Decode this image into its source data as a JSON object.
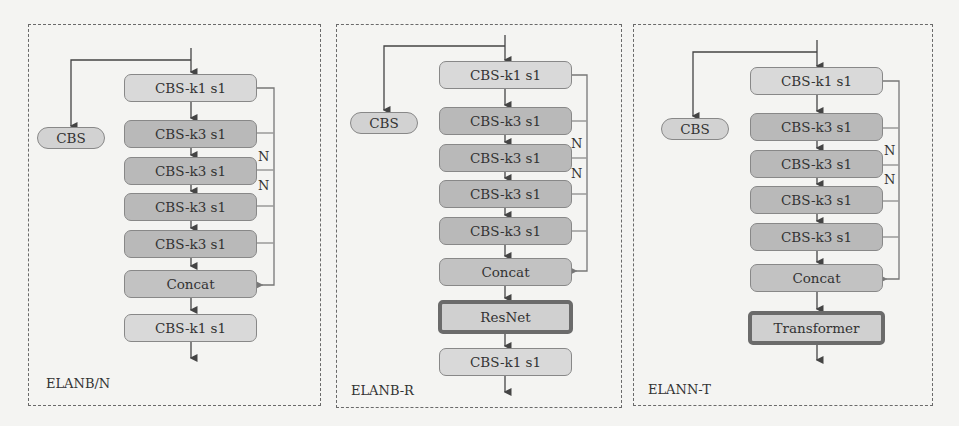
{
  "panels": [
    {
      "label": "ELANB/N",
      "cbs": "CBS",
      "blocks": [
        "CBS-k1 s1",
        "CBS-k3 s1",
        "CBS-k3 s1",
        "CBS-k3 s1",
        "CBS-k3 s1",
        "Concat",
        "CBS-k1 s1"
      ],
      "n_labels": [
        "N",
        "N"
      ]
    },
    {
      "label": "ELANB-R",
      "cbs": "CBS",
      "blocks": [
        "CBS-k1 s1",
        "CBS-k3 s1",
        "CBS-k3 s1",
        "CBS-k3 s1",
        "CBS-k3 s1",
        "Concat",
        "ResNet",
        "CBS-k1 s1"
      ],
      "n_labels": [
        "N",
        "N"
      ]
    },
    {
      "label": "ELANN-T",
      "cbs": "CBS",
      "blocks": [
        "CBS-k1 s1",
        "CBS-k3 s1",
        "CBS-k3 s1",
        "CBS-k3 s1",
        "CBS-k3 s1",
        "Concat",
        "Transformer"
      ],
      "n_labels": [
        "N",
        "N"
      ]
    }
  ]
}
